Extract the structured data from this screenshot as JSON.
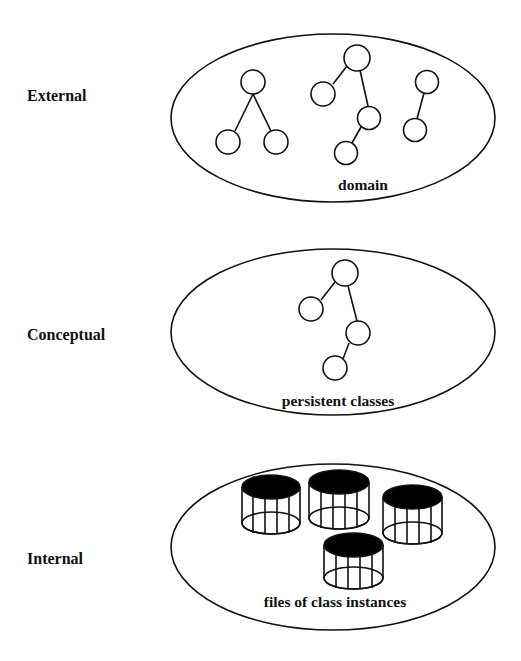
{
  "diagram": {
    "levels": [
      {
        "label": "External",
        "caption": "domain",
        "content": "trees",
        "trees": [
          {
            "nodes": [
              [
                253,
                82
              ],
              [
                228,
                142
              ],
              [
                276,
                142
              ]
            ],
            "edges": [
              [
                0,
                1
              ],
              [
                0,
                2
              ]
            ]
          },
          {
            "nodes": [
              [
                357,
                58
              ],
              [
                323,
                94
              ],
              [
                369,
                118
              ],
              [
                346,
                153
              ]
            ],
            "edges": [
              [
                0,
                1
              ],
              [
                0,
                2
              ],
              [
                2,
                3
              ]
            ]
          },
          {
            "nodes": [
              [
                427,
                82
              ],
              [
                415,
                130
              ]
            ],
            "edges": [
              [
                0,
                1
              ]
            ]
          }
        ]
      },
      {
        "label": "Conceptual",
        "caption": "persistent classes",
        "content": "trees",
        "trees": [
          {
            "nodes": [
              [
                345,
                273
              ],
              [
                311,
                309
              ],
              [
                358,
                333
              ],
              [
                335,
                368
              ]
            ],
            "edges": [
              [
                0,
                1
              ],
              [
                0,
                2
              ],
              [
                2,
                3
              ]
            ]
          }
        ]
      },
      {
        "label": "Internal",
        "caption": "files of class instances",
        "content": "cylinders",
        "cylinders": 4
      }
    ],
    "colors": {
      "stroke": "#111111",
      "fill": "#ffffff",
      "cylinder_top": "#000000"
    }
  }
}
